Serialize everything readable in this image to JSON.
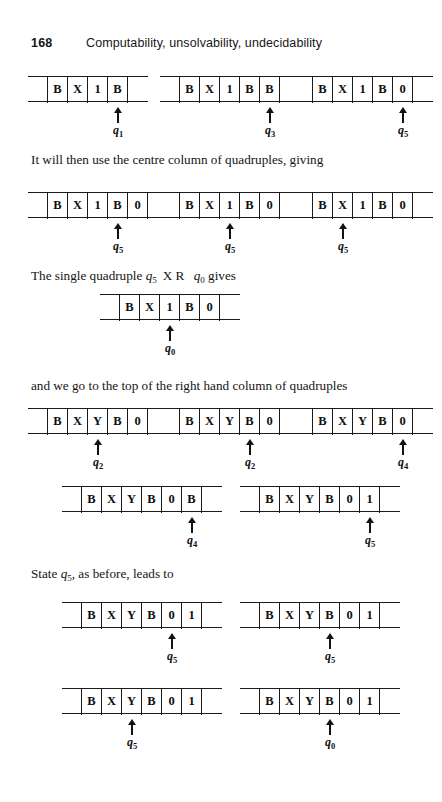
{
  "header": {
    "folio": "168",
    "running_head": "Computability, unsolvability, undecidability"
  },
  "colors": {
    "ink": "#111111",
    "rule": "#1a1a1a",
    "paper": "#ffffff"
  },
  "paragraphs": {
    "p1_text": "It will then use the centre column of quadruples, giving",
    "p2_before": "The single quadruple ",
    "p2_q1": "q",
    "p2_q1_sub": "5",
    "p2_mid": "X  R ",
    "p2_q2": "q",
    "p2_q2_sub": "0",
    "p2_after": " gives",
    "p3_text": "and we go to the top of the right hand column of quadruples",
    "p4_before": "State ",
    "p4_q": "q",
    "p4_q_sub": "5",
    "p4_after": ", as before, leads to"
  },
  "tape_rows": [
    {
      "name": "tape-row-1",
      "tapes": [
        {
          "name": "tape-1-1",
          "left": 28,
          "lead_cells": 1,
          "cells": [
            "B",
            "X",
            "1",
            "B"
          ],
          "tail_cells": 1,
          "head_index": 3,
          "state": "q",
          "state_sub": "1"
        },
        {
          "name": "tape-1-2",
          "left": 160,
          "lead_cells": 1,
          "cells": [
            "B",
            "X",
            "1",
            "B",
            "B"
          ],
          "tail_cells": 1,
          "head_index": 4,
          "state": "q",
          "state_sub": "3"
        },
        {
          "name": "tape-1-3",
          "left": 293,
          "lead_cells": 1,
          "cells": [
            "B",
            "X",
            "1",
            "B",
            "0"
          ],
          "tail_cells": 1,
          "head_index": 4,
          "state": "q",
          "state_sub": "5"
        }
      ]
    },
    {
      "name": "tape-row-2",
      "tapes": [
        {
          "name": "tape-2-1",
          "left": 28,
          "lead_cells": 1,
          "cells": [
            "B",
            "X",
            "1",
            "B",
            "0"
          ],
          "tail_cells": 1,
          "head_index": 3,
          "state": "q",
          "state_sub": "5"
        },
        {
          "name": "tape-2-2",
          "left": 160,
          "lead_cells": 1,
          "cells": [
            "B",
            "X",
            "1",
            "B",
            "0"
          ],
          "tail_cells": 1,
          "head_index": 2,
          "state": "q",
          "state_sub": "5"
        },
        {
          "name": "tape-2-3",
          "left": 293,
          "lead_cells": 1,
          "cells": [
            "B",
            "X",
            "1",
            "B",
            "0"
          ],
          "tail_cells": 1,
          "head_index": 1,
          "state": "q",
          "state_sub": "5"
        }
      ]
    },
    {
      "name": "tape-row-3",
      "tapes": [
        {
          "name": "tape-3-1",
          "left": 100,
          "lead_cells": 1,
          "cells": [
            "B",
            "X",
            "1",
            "B",
            "0"
          ],
          "tail_cells": 1,
          "head_index": 2,
          "state": "q",
          "state_sub": "0"
        }
      ]
    },
    {
      "name": "tape-row-4",
      "tapes": [
        {
          "name": "tape-4-1",
          "left": 28,
          "lead_cells": 1,
          "cells": [
            "B",
            "X",
            "Y",
            "B",
            "0"
          ],
          "tail_cells": 1,
          "head_index": 2,
          "state": "q",
          "state_sub": "2"
        },
        {
          "name": "tape-4-2",
          "left": 160,
          "lead_cells": 1,
          "cells": [
            "B",
            "X",
            "Y",
            "B",
            "0"
          ],
          "tail_cells": 1,
          "head_index": 3,
          "state": "q",
          "state_sub": "2"
        },
        {
          "name": "tape-4-3",
          "left": 293,
          "lead_cells": 1,
          "cells": [
            "B",
            "X",
            "Y",
            "B",
            "0"
          ],
          "tail_cells": 1,
          "head_index": 4,
          "state": "q",
          "state_sub": "4"
        }
      ]
    },
    {
      "name": "tape-row-5",
      "tapes": [
        {
          "name": "tape-5-1",
          "left": 62,
          "lead_cells": 1,
          "cells": [
            "B",
            "X",
            "Y",
            "B",
            "0",
            "B"
          ],
          "tail_cells": 1,
          "head_index": 5,
          "state": "q",
          "state_sub": "4"
        },
        {
          "name": "tape-5-2",
          "left": 240,
          "lead_cells": 1,
          "cells": [
            "B",
            "X",
            "Y",
            "B",
            "0",
            "1"
          ],
          "tail_cells": 1,
          "head_index": 5,
          "state": "q",
          "state_sub": "5"
        }
      ]
    },
    {
      "name": "tape-row-6",
      "tapes": [
        {
          "name": "tape-6-1",
          "left": 62,
          "lead_cells": 1,
          "cells": [
            "B",
            "X",
            "Y",
            "B",
            "0",
            "1"
          ],
          "tail_cells": 1,
          "head_index": 4,
          "state": "q",
          "state_sub": "5"
        },
        {
          "name": "tape-6-2",
          "left": 240,
          "lead_cells": 1,
          "cells": [
            "B",
            "X",
            "Y",
            "B",
            "0",
            "1"
          ],
          "tail_cells": 1,
          "head_index": 3,
          "state": "q",
          "state_sub": "5"
        }
      ]
    },
    {
      "name": "tape-row-7",
      "tapes": [
        {
          "name": "tape-7-1",
          "left": 62,
          "lead_cells": 1,
          "cells": [
            "B",
            "X",
            "Y",
            "B",
            "0",
            "1"
          ],
          "tail_cells": 1,
          "head_index": 2,
          "state": "q",
          "state_sub": "5"
        },
        {
          "name": "tape-7-2",
          "left": 240,
          "lead_cells": 1,
          "cells": [
            "B",
            "X",
            "Y",
            "B",
            "0",
            "1"
          ],
          "tail_cells": 1,
          "head_index": 3,
          "state": "q",
          "state_sub": "0"
        }
      ]
    }
  ],
  "row_tops": [
    76,
    192,
    294,
    408,
    486,
    602,
    688
  ],
  "paragraph_tops": {
    "p1": 152,
    "p2": 268,
    "p3": 378,
    "p4": 566
  }
}
